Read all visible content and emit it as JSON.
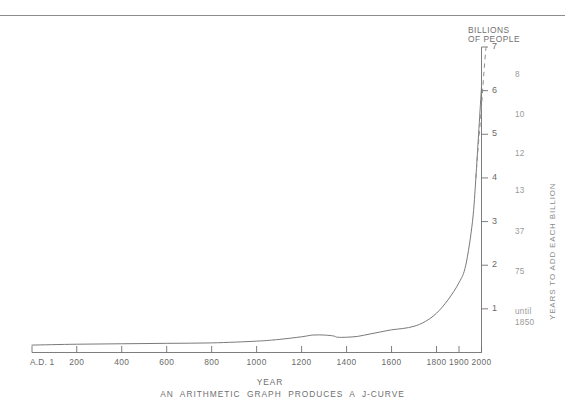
{
  "chart_data": {
    "type": "line",
    "title": "",
    "caption": "AN  ARITHMETIC  GRAPH  PRODUCES  A  J-CURVE",
    "ylabel": "BILLIONS\nOF PEOPLE",
    "xlabel": "YEAR",
    "right_axis_label": "YEARS TO ADD EACH BILLION",
    "xlim": [
      1,
      2000
    ],
    "ylim": [
      0,
      7
    ],
    "grid": false,
    "legend": null,
    "x_ticks": [
      {
        "value": 1,
        "label": "A.D. 1"
      },
      {
        "value": 200,
        "label": "200"
      },
      {
        "value": 400,
        "label": "400"
      },
      {
        "value": 600,
        "label": "600"
      },
      {
        "value": 800,
        "label": "800"
      },
      {
        "value": 1000,
        "label": "1000"
      },
      {
        "value": 1200,
        "label": "1200"
      },
      {
        "value": 1400,
        "label": "1400"
      },
      {
        "value": 1600,
        "label": "1600"
      },
      {
        "value": 1800,
        "label": "1800"
      },
      {
        "value": 1900,
        "label": "1900"
      },
      {
        "value": 2000,
        "label": "2000"
      }
    ],
    "y_ticks": [
      {
        "value": 1,
        "label": "1"
      },
      {
        "value": 2,
        "label": "2"
      },
      {
        "value": 3,
        "label": "3"
      },
      {
        "value": 4,
        "label": "4"
      },
      {
        "value": 5,
        "label": "5"
      },
      {
        "value": 6,
        "label": "6"
      },
      {
        "value": 7,
        "label": "7"
      }
    ],
    "series": [
      {
        "name": "World population (historical)",
        "style": "solid",
        "x": [
          1,
          200,
          400,
          600,
          800,
          1000,
          1100,
          1200,
          1250,
          1300,
          1340,
          1360,
          1400,
          1450,
          1500,
          1550,
          1600,
          1650,
          1700,
          1750,
          1800,
          1850,
          1900,
          1930,
          1960,
          1975,
          1987,
          1999,
          2000
        ],
        "y": [
          0.17,
          0.19,
          0.2,
          0.21,
          0.22,
          0.26,
          0.3,
          0.36,
          0.4,
          0.4,
          0.38,
          0.35,
          0.35,
          0.37,
          0.42,
          0.47,
          0.52,
          0.55,
          0.6,
          0.71,
          0.9,
          1.2,
          1.6,
          2.0,
          3.0,
          4.0,
          5.0,
          6.0,
          6.1
        ]
      },
      {
        "name": "Projection",
        "style": "dashed",
        "x": [
          1975,
          1982,
          1990,
          1998,
          2005,
          2012,
          2020
        ],
        "y": [
          4.0,
          4.5,
          5.0,
          5.5,
          6.0,
          6.5,
          7.0
        ]
      }
    ],
    "right_annotations": [
      {
        "label": "8",
        "at_billions": 6.35
      },
      {
        "label": "10",
        "at_billions": 5.45
      },
      {
        "label": "12",
        "at_billions": 4.55
      },
      {
        "label": "13",
        "at_billions": 3.7
      },
      {
        "label": "37",
        "at_billions": 2.75
      },
      {
        "label": "75",
        "at_billions": 1.85
      },
      {
        "label": "until\n1850",
        "at_billions": 0.85
      }
    ]
  }
}
